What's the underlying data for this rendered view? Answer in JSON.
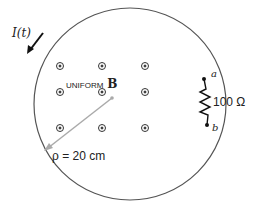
{
  "diagram": {
    "current_label": "I(t)",
    "field_label_prefix": "UNIFORM",
    "field_label_symbol": "B",
    "resistor_label": "100 Ω",
    "terminal_a": "a",
    "terminal_b": "b",
    "radius_label": "ρ = 20 cm",
    "field_symbol": "dot-in-circle (out of page)",
    "field_markers": 8,
    "colors": {
      "circle": "#555555",
      "radius_arrow": "#aaaaaa",
      "text": "#222222",
      "current_arrow": "#111111"
    }
  }
}
